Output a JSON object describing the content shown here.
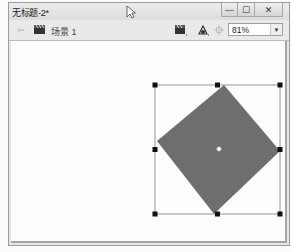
{
  "window": {
    "title": "无标题-2*",
    "controls": {
      "minimize": "—",
      "maximize": "☐",
      "close": "✕"
    }
  },
  "toolbar": {
    "back_icon": "arrow-left-icon",
    "scene_icon": "clapboard-icon",
    "scene_label": "场景 1",
    "edit_scene_icon": "clapboard-edit-icon",
    "edit_symbol_icon": "symbol-edit-icon",
    "center_stage_icon": "center-stage-icon",
    "zoom": {
      "value": "81%",
      "dropdown_glyph": "▼"
    }
  },
  "stage": {
    "shape": {
      "type": "rotated-square",
      "fill": "#6e6e6e",
      "points": [
        [
          213,
          44
        ],
        [
          269,
          110
        ],
        [
          203,
          173
        ],
        [
          146,
          100
        ]
      ]
    },
    "selection_box": {
      "x": 144,
      "y": 44,
      "width": 125,
      "height": 129,
      "stroke": "#7a7a7a",
      "handle_color": "#111111"
    },
    "transform_point": {
      "x": 208,
      "y": 108
    }
  },
  "colors": {
    "window_bg": "#e6e6e6",
    "canvas_bg": "#fdfdfd",
    "shape_fill": "#6e6e6e"
  }
}
